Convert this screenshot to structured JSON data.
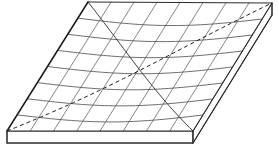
{
  "figure": {
    "object_name": "plate",
    "view": "oblique perspective",
    "background_color": "#ffffff"
  },
  "geometry": {
    "top_face": {
      "name": "top-surface",
      "corners": {
        "back_left": {
          "label": "A",
          "x": 88,
          "y": 2
        },
        "back_right": {
          "label": "B",
          "x": 272,
          "y": 3
        },
        "front_right": {
          "label": "C",
          "x": 193,
          "y": 131
        },
        "front_left": {
          "label": "D",
          "x": 7,
          "y": 131
        }
      }
    },
    "thickness_px": 12,
    "bottom_face": {
      "name": "bottom-surface",
      "corners": {
        "front_left": {
          "x": 7,
          "y": 143
        },
        "front_right": {
          "x": 193,
          "y": 143
        },
        "back_right": {
          "x": 272,
          "y": 15
        }
      }
    }
  },
  "mesh": {
    "name": "curvilinear-grid",
    "divisions_u": 8,
    "divisions_v": 8,
    "u_line_count": 7,
    "v_line_count": 7,
    "curvature": {
      "u_lines_sag_px": 0,
      "v_lines_sag_px": 7,
      "sag_direction": "downward"
    },
    "stroke_color": "#5e5e5e",
    "stroke_width": 0.75
  },
  "diagonals": [
    {
      "name": "diagonal-solid",
      "style": "solid",
      "from": "back_left",
      "to": "front_right",
      "color": "#2a2a2a"
    },
    {
      "name": "diagonal-dashed",
      "style": "dashed",
      "from": "front_left",
      "to": "back_right",
      "color": "#1f1f1f",
      "dash_pattern": "4 3"
    }
  ],
  "colors": {
    "outline": "#1a1a1a",
    "grid": "#5e5e5e",
    "grid_horizontal": "#555555",
    "diagonal_solid": "#2a2a2a",
    "diagonal_dashed": "#1f1f1f",
    "face_fill": "#ffffff",
    "background": "#ffffff"
  },
  "labels": {
    "visible_text": []
  }
}
